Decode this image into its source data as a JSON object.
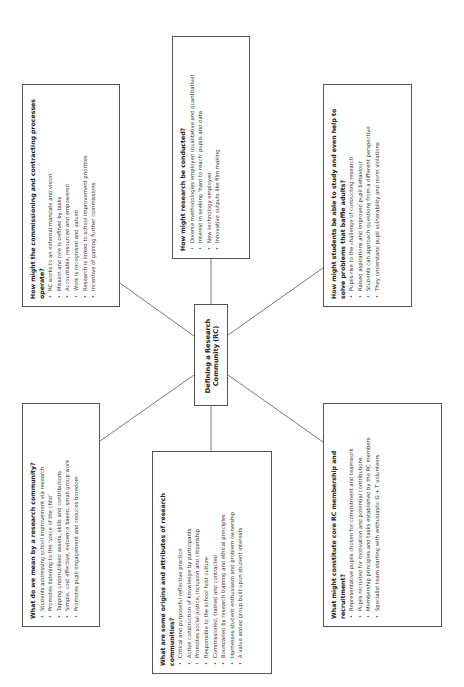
{
  "diagram": {
    "center": {
      "title": "Defining a Research Community (RC)"
    },
    "boxes": {
      "commissioning": {
        "title": "How might the commissioning and contracting processes operate?",
        "items": [
          "RC works to an external mandate and vision",
          "Mission and role is defined by tasks",
          "Accountable, resourced and empowered",
          "Work is recognised and valued",
          "Research is linked to school improvement priorities",
          "Incentive of gaining further commissions"
        ]
      },
      "conducted": {
        "title": "How might research be conducted?",
        "items": [
          "Diverse methodologies employed (qualitative and quantitative)",
          "Interest in seeking 'hard to reach' pupils and data",
          "New technology employed",
          "Innovative outputs like film making"
        ]
      },
      "students": {
        "title": "How might students be able to study and even help to solve problems that baffle adults?",
        "items": [
          "Pupils rise to the challenge of conducting research",
          "Raised aspirations and improved pupil behaviour",
          "Students can approach questions from a different perspective",
          "They understand pupil vulnerability and norm violations"
        ]
      },
      "meaning": {
        "title": "What do we mean by a research community?",
        "items": [
          "Students addressing school improvement via research",
          "Promotes listening to the 'voice of the child'",
          "Tapping underutilised assets, skills and contributions",
          "Simple, cost effective, evidence based, small group work",
          "Promotes pupil engagement and reduces boredom"
        ]
      },
      "origins": {
        "title": "What are some origins and attributes of research communities?",
        "items": [
          "Critical and purposeful reflective practice",
          "Active construction of knowledge by participants",
          "Promotes social justice, inclusion and citizenship",
          "Responsible to the school host culture",
          "Commissioned, trained and contracted",
          "Boundaried by research training and ethical principles",
          "Harnesses student enthusiasm and problem ownership",
          "A value added group built upon student interests"
        ]
      },
      "membership": {
        "title": "What might constitute core RC membership and recruitment?",
        "items": [
          "Representative pupils chosen for commitment and teamwork",
          "Pupils recruited for motivation and potential contributions",
          "Membership principles and tasks established by the RC members",
          "Specialist team starting with enthusiastic G + T volunteers"
        ]
      }
    },
    "colors": {
      "line": "#555555",
      "border": "#555555",
      "text": "#222222"
    }
  }
}
